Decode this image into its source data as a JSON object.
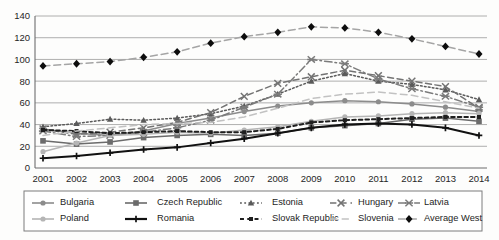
{
  "chart_data": {
    "type": "line",
    "title": "",
    "xlabel": "",
    "ylabel": "",
    "ylim": [
      0,
      140
    ],
    "ytick_step": 20,
    "yticks": [
      0,
      20,
      40,
      60,
      80,
      100,
      120,
      140
    ],
    "grid": true,
    "legend_position": "bottom",
    "legend_columns": 5,
    "legend_rows": 2,
    "categories": [
      "2001",
      "2002",
      "2003",
      "2004",
      "2005",
      "2006",
      "2007",
      "2008",
      "2009",
      "2010",
      "2011",
      "2012",
      "2013",
      "2014"
    ],
    "series": [
      {
        "name": "Bulgaria",
        "marker": "circle",
        "linestyle": "solid",
        "color": "#8c8c8c",
        "values": [
          36,
          32,
          30,
          34,
          41,
          46,
          52,
          57,
          60,
          62,
          61,
          59,
          56,
          52
        ]
      },
      {
        "name": "Czech Republic",
        "marker": "square",
        "linestyle": "solid",
        "color": "#6b6b6b",
        "values": [
          25,
          22,
          24,
          28,
          30,
          31,
          30,
          32,
          37,
          39,
          41,
          45,
          46,
          43
        ]
      },
      {
        "name": "Estonia",
        "marker": "triangle",
        "linestyle": "dotted",
        "color": "#5a5a5a",
        "values": [
          38,
          41,
          45,
          44,
          46,
          50,
          57,
          68,
          80,
          87,
          80,
          77,
          72,
          63
        ]
      },
      {
        "name": "Hungary",
        "marker": "star-x",
        "linestyle": "dashed",
        "color": "#737373",
        "values": [
          36,
          31,
          33,
          37,
          42,
          51,
          66,
          78,
          84,
          90,
          85,
          80,
          75,
          55
        ]
      },
      {
        "name": "Latvia",
        "marker": "star-burst",
        "linestyle": "dash-dot",
        "color": "#7b7b7b",
        "values": [
          34,
          29,
          30,
          33,
          37,
          44,
          56,
          68,
          100,
          96,
          82,
          73,
          66,
          56
        ]
      },
      {
        "name": "Poland",
        "marker": "circle",
        "linestyle": "solid",
        "color": "#b5b5b5",
        "values": [
          15,
          23,
          30,
          31,
          33,
          32,
          35,
          38,
          43,
          47,
          48,
          50,
          51,
          50
        ]
      },
      {
        "name": "Romania",
        "marker": "plus",
        "linestyle": "solid",
        "color": "#111111",
        "values": [
          9,
          11,
          14,
          17,
          19,
          23,
          27,
          32,
          37,
          40,
          41,
          40,
          37,
          30
        ]
      },
      {
        "name": "Slovak Republic",
        "marker": "small-square",
        "linestyle": "dotted-bold",
        "color": "#1f1f1f",
        "values": [
          35,
          34,
          32,
          33,
          34,
          33,
          33,
          36,
          42,
          44,
          45,
          46,
          47,
          47
        ]
      },
      {
        "name": "Slovenia",
        "marker": "none",
        "linestyle": "dashed-light",
        "color": "#c2c2c2",
        "values": [
          30,
          34,
          37,
          40,
          41,
          42,
          47,
          55,
          64,
          68,
          70,
          67,
          61,
          55
        ]
      },
      {
        "name": "Average West",
        "marker": "diamond",
        "linestyle": "dash-dot-light",
        "color": "#a5a5a5",
        "marker_color": "#0d0d0d",
        "values": [
          94,
          96,
          98,
          102,
          107,
          115,
          121,
          125,
          130,
          129,
          125,
          119,
          112,
          105
        ]
      }
    ]
  },
  "legend": {
    "entries": [
      {
        "label": "Bulgaria"
      },
      {
        "label": "Czech Republic"
      },
      {
        "label": "Estonia"
      },
      {
        "label": "Hungary"
      },
      {
        "label": "Latvia"
      },
      {
        "label": "Poland"
      },
      {
        "label": "Romania"
      },
      {
        "label": "Slovak Republic"
      },
      {
        "label": "Slovenia"
      },
      {
        "label": "Average West"
      }
    ]
  }
}
